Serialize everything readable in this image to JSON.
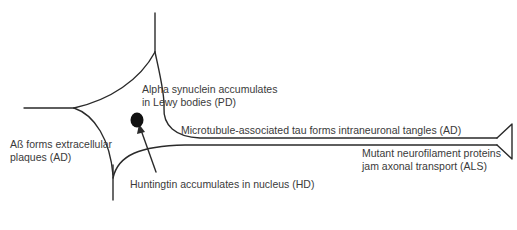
{
  "diagram": {
    "type": "neuron-schematic",
    "stroke_color": "#2a2a2a",
    "text_color": "#3a3a3a",
    "parts": {
      "nucleus": "nucleus-dot",
      "axon": "axon",
      "dendrites": "dendrites",
      "axon_terminal": "axon-terminal"
    },
    "labels": {
      "alpha_synuclein": {
        "line1": "Alpha synuclein accumulates",
        "line2": "in Lewy bodies (PD)"
      },
      "tau": {
        "line1": "Microtubule-associated tau forms intraneuronal tangles (AD)"
      },
      "neurofilament": {
        "line1": "Mutant neurofilament proteins",
        "line2": "jam axonal transport (ALS)"
      },
      "abeta": {
        "line1": "Aß forms extracellular",
        "line2": "plaques (AD)"
      },
      "huntingtin": {
        "line1": "Huntingtin accumulates in nucleus (HD)"
      }
    }
  }
}
